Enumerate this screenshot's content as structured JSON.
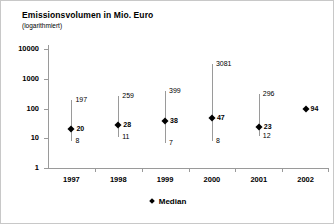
{
  "chart_data": {
    "type": "scatter",
    "title": "Emissionsvolumen in Mio. Euro",
    "subtitle": "(logarithmiert)",
    "xlabel": "",
    "ylabel": "",
    "scale": "log",
    "ylim": [
      1,
      10000
    ],
    "ytick_labels": [
      "10000",
      "1000",
      "100",
      "10",
      "1"
    ],
    "ytick_values": [
      10000,
      1000,
      100,
      10,
      1
    ],
    "grid": false,
    "legend_position": "bottom-center",
    "legend": [
      {
        "marker": "diamond",
        "label": "Median"
      }
    ],
    "categories": [
      "1997",
      "1998",
      "1999",
      "2000",
      "2001",
      "2002"
    ],
    "series": [
      {
        "name": "Maximum",
        "values": [
          197,
          259,
          399,
          3081,
          296,
          null
        ]
      },
      {
        "name": "Median",
        "values": [
          20,
          28,
          38,
          47,
          23,
          94
        ]
      },
      {
        "name": "Minimum",
        "values": [
          8,
          11,
          7,
          8,
          12,
          null
        ]
      }
    ],
    "points": [
      {
        "category": "1997",
        "max": 197,
        "median": 20,
        "min": 8,
        "max_label": "197",
        "median_label": "20",
        "min_label": "8"
      },
      {
        "category": "1998",
        "max": 259,
        "median": 28,
        "min": 11,
        "max_label": "259",
        "median_label": "28",
        "min_label": "11"
      },
      {
        "category": "1999",
        "max": 399,
        "median": 38,
        "min": 7,
        "max_label": "399",
        "median_label": "38",
        "min_label": "7"
      },
      {
        "category": "2000",
        "max": 3081,
        "median": 47,
        "min": 8,
        "max_label": "3081",
        "median_label": "47",
        "min_label": "8"
      },
      {
        "category": "2001",
        "max": 296,
        "median": 23,
        "min": 12,
        "max_label": "296",
        "median_label": "23",
        "min_label": "12"
      },
      {
        "category": "2002",
        "max": null,
        "median": 94,
        "min": null,
        "max_label": "",
        "median_label": "94",
        "min_label": ""
      }
    ],
    "colors": {
      "marker": "#000000",
      "range_line": "#9a9a9a",
      "axis": "#9a9a9a",
      "text": "#000000",
      "background": "#ffffff",
      "frame": "#c8c8c8"
    }
  }
}
